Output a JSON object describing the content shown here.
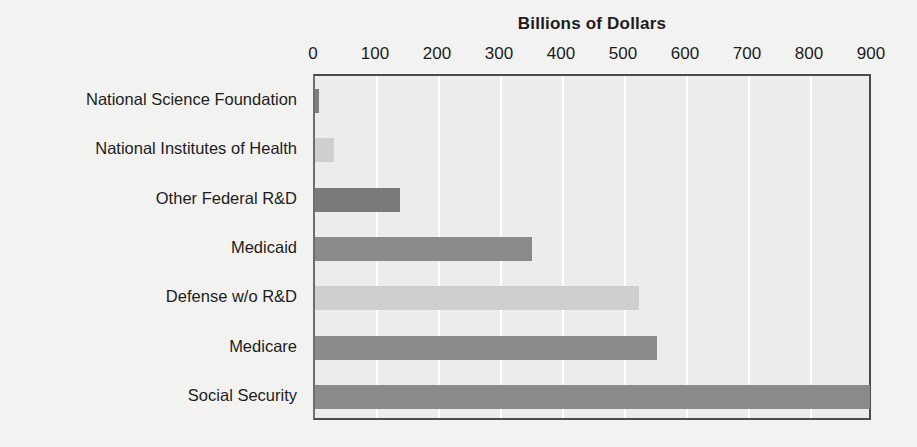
{
  "chart_data": {
    "type": "bar",
    "orientation": "horizontal",
    "title": "Billions of Dollars",
    "xlabel": "",
    "ylabel": "",
    "xlim": [
      0,
      900
    ],
    "ylim": [
      0,
      7
    ],
    "grid": true,
    "legend": "none",
    "xticks": [
      0,
      100,
      200,
      300,
      400,
      500,
      600,
      700,
      800,
      900
    ],
    "xtick_labels": [
      "0",
      "100",
      "200",
      "300",
      "400",
      "500",
      "600",
      "700",
      "800",
      "900"
    ],
    "categories": [
      "National Science Foundation",
      "National Institutes of Health",
      "Other Federal R&D",
      "Medicaid",
      "Defense w/o R&D",
      "Medicare",
      "Social Security"
    ],
    "values": [
      6,
      30,
      137,
      350,
      522,
      552,
      895
    ],
    "bar_colors": [
      "#7e7e7e",
      "#cfcfcf",
      "#7a7a7a",
      "#8a8a8a",
      "#cfcfcf",
      "#8a8a8a",
      "#8a8a8a"
    ],
    "plot_background": "#ececeb",
    "page_background": "#f2f2f0",
    "gridline_color": "#ffffff",
    "axis_color": "#4b4b4b",
    "text_color": "#1d1d1d"
  }
}
